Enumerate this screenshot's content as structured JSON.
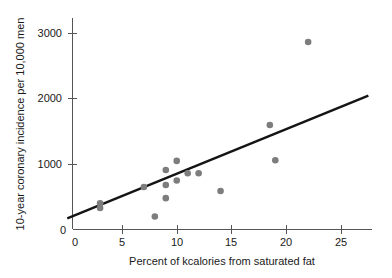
{
  "chart_data": {
    "type": "scatter",
    "title": "",
    "xlabel": "Percent of kcalories from saturated fat",
    "ylabel": "10-year coronary incidence per 10,000 men",
    "xlim": [
      0,
      27.5
    ],
    "ylim": [
      0,
      3300
    ],
    "xticks": [
      0,
      5,
      10,
      15,
      20,
      25
    ],
    "xticklabels": [
      "0",
      "5",
      "10",
      "15",
      "20",
      "25"
    ],
    "yticks": [
      0,
      1000,
      2000,
      3000
    ],
    "yticklabels": [
      "0",
      "1000",
      "2000",
      "3000"
    ],
    "grid": false,
    "legend": null,
    "marker_color": "#7d7d7d",
    "line_color": "#141414",
    "axis_color": "#555555",
    "points": [
      {
        "x": 3.0,
        "y": 400
      },
      {
        "x": 3.0,
        "y": 330
      },
      {
        "x": 7.0,
        "y": 650
      },
      {
        "x": 8.0,
        "y": 200
      },
      {
        "x": 9.0,
        "y": 480
      },
      {
        "x": 9.0,
        "y": 680
      },
      {
        "x": 9.0,
        "y": 910
      },
      {
        "x": 10.0,
        "y": 1050
      },
      {
        "x": 10.0,
        "y": 750
      },
      {
        "x": 11.0,
        "y": 860
      },
      {
        "x": 12.0,
        "y": 860
      },
      {
        "x": 14.0,
        "y": 590
      },
      {
        "x": 18.5,
        "y": 1600
      },
      {
        "x": 19.0,
        "y": 1060
      },
      {
        "x": 22.0,
        "y": 2870
      }
    ],
    "fit_line": {
      "label": "least-squares regression line",
      "x_start": 0,
      "y_start": 170,
      "x_end": 27.5,
      "y_end": 2050
    }
  }
}
